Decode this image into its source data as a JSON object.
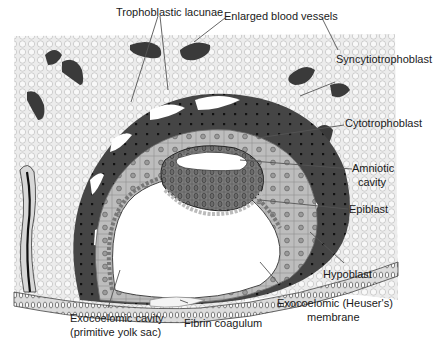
{
  "figure": {
    "colors": {
      "background": "#ffffff",
      "stroma": "#e9e9e9",
      "syncytiotrophoblast": "#4a4a4a",
      "cytotrophoblast": "#b9b9b9",
      "epiblast": "#7d7d7d",
      "vessel": "#3a3a3a",
      "line": "#555555"
    }
  },
  "labels": {
    "trophoblastic_lacunae": "Trophoblastic lacunae",
    "enlarged_blood_vessels": "Enlarged blood vessels",
    "syncytiotrophoblast": "Syncytiotrophoblast",
    "cytotrophoblast": "Cytotrophoblast",
    "amniotic_cavity_line1": "Amniotic",
    "amniotic_cavity_line2": "cavity",
    "epiblast": "Epiblast",
    "hypoblast": "Hypoblast",
    "exocoelomic_membrane_line1": "Exocoelomic (Heuser's)",
    "exocoelomic_membrane_line2": "membrane",
    "exocoelomic_cavity_line1": "Exocoelomic cavity",
    "exocoelomic_cavity_line2": "(primitive yolk sac)",
    "fibrin_coagulum": "Fibrin coagulum"
  }
}
